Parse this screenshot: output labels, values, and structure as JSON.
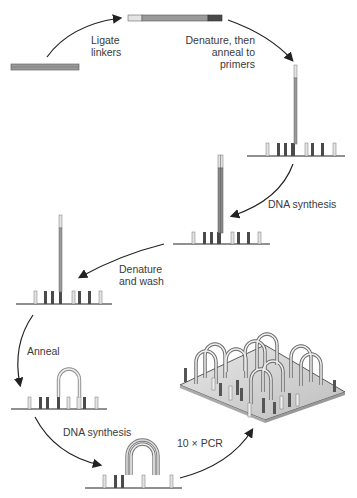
{
  "steps": [
    {
      "id": "ligate",
      "label_line1": "Ligate",
      "label_line2": "linkers"
    },
    {
      "id": "denature_anneal",
      "label_line1": "Denature, then",
      "label_line2": "anneal to",
      "label_line3": "primers"
    },
    {
      "id": "dna_synthesis_1",
      "label_line1": "DNA synthesis"
    },
    {
      "id": "denature_wash",
      "label_line1": "Denature",
      "label_line2": "and wash"
    },
    {
      "id": "anneal",
      "label_line1": "Anneal"
    },
    {
      "id": "dna_synthesis_2",
      "label_line1": "DNA synthesis"
    },
    {
      "id": "pcr",
      "label_line1": "10 × PCR"
    }
  ],
  "colors": {
    "strand_light": "#d9d9d9",
    "strand_mid": "#8c8c8c",
    "strand_dark": "#4d4d4d",
    "arrow": "#222222",
    "surface": "#222222"
  }
}
